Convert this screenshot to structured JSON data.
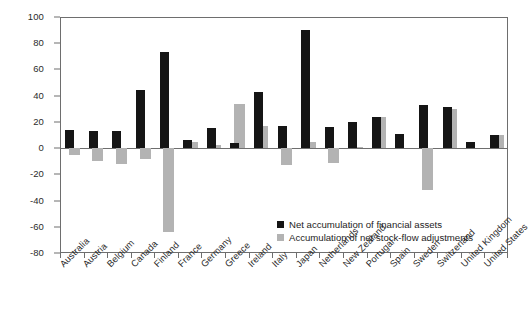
{
  "chart_data": {
    "type": "bar",
    "title": "",
    "subtitle": "",
    "xlabel": "",
    "ylabel": "",
    "ylim": [
      -80,
      100
    ],
    "ytick_step": 20,
    "yticks": [
      100,
      80,
      60,
      40,
      20,
      0,
      -20,
      -40,
      -60,
      -80
    ],
    "ytick_labels": [
      "100",
      "80",
      "60",
      "40",
      "20",
      "0",
      "-20",
      "-40",
      "-60",
      "-80"
    ],
    "grid": false,
    "legend_position": "inside-bottom-right",
    "bar_mode": "overlapping",
    "categories": [
      "Australia",
      "Austria",
      "Belgium",
      "Canada",
      "Finland",
      "France",
      "Germany",
      "Greece",
      "Ireland",
      "Italy",
      "Japan",
      "Netherlands",
      "New Zealand",
      "Portugal",
      "Spain",
      "Sweden",
      "Switzerland",
      "United Kingdom",
      "United States"
    ],
    "series": [
      {
        "name": "Net accumulation of financial assets",
        "color": "#151515",
        "values": [
          14,
          13,
          13,
          44,
          73,
          6,
          15,
          4,
          43,
          17,
          90,
          16,
          20,
          24,
          11,
          33,
          31,
          5,
          10
        ]
      },
      {
        "name": "Accumulation of net stock-flow adjustments",
        "color": "#b3b3b3",
        "values": [
          -5,
          -10,
          -12,
          -8,
          -64,
          5,
          2,
          34,
          17,
          -13,
          5,
          -11,
          1,
          24,
          0,
          -32,
          30,
          0,
          10
        ]
      }
    ]
  },
  "legend": {
    "items": [
      {
        "label": "Net accumulation of financial assets",
        "swatch": "black"
      },
      {
        "label": "Accumulation of net stock-flow adjustments",
        "swatch": "gray"
      }
    ]
  },
  "colors": {
    "series_black": "#151515",
    "series_gray": "#b3b3b3",
    "axis": "#6e6e6e",
    "text": "#2b2b2b",
    "background": "#ffffff"
  }
}
